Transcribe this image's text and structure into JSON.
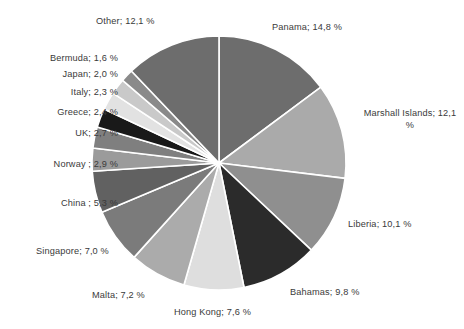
{
  "chart_data": {
    "type": "pie",
    "title": "",
    "subtitle": "",
    "xlabel": "",
    "ylabel": "",
    "legend_position": "none",
    "grid": false,
    "value_suffix": " %",
    "decimal_separator": ",",
    "label_separator": "; ",
    "start_angle_deg": 0,
    "direction": "clockwise",
    "categories": [
      "Panama",
      "Marshall Islands",
      "Liberia",
      "Bahamas",
      "Hong Kong",
      "Malta",
      "Singapore",
      "China ",
      "Norway ",
      "UK",
      "Greece",
      "Italy",
      "Japan",
      "Bermuda",
      "Other"
    ],
    "values": [
      14.8,
      12.1,
      10.1,
      9.8,
      7.6,
      7.2,
      7.0,
      5.3,
      2.9,
      2.7,
      2.4,
      2.3,
      2.0,
      1.6,
      12.1
    ],
    "total": 100.0,
    "slices": [
      {
        "name": "Panama",
        "value": 14.8,
        "label": "Panama; 14,8 %",
        "color": "#6d6d6d"
      },
      {
        "name": "Marshall Islands",
        "value": 12.1,
        "label": "Marshall Islands; 12,1\n%",
        "color": "#aaaaaa"
      },
      {
        "name": "Liberia",
        "value": 10.1,
        "label": "Liberia; 10,1 %",
        "color": "#8f8f8f"
      },
      {
        "name": "Bahamas",
        "value": 9.8,
        "label": "Bahamas; 9,8 %",
        "color": "#2b2b2b"
      },
      {
        "name": "Hong Kong",
        "value": 7.6,
        "label": "Hong Kong; 7,6 %",
        "color": "#dedede"
      },
      {
        "name": "Malta",
        "value": 7.2,
        "label": "Malta; 7,2 %",
        "color": "#ababab"
      },
      {
        "name": "Singapore",
        "value": 7.0,
        "label": "Singapore; 7,0 %",
        "color": "#7b7b7b"
      },
      {
        "name": "China ",
        "value": 5.3,
        "label": "China ; 5,3 %",
        "color": "#616161"
      },
      {
        "name": "Norway ",
        "value": 2.9,
        "label": "Norway ; 2,9 %",
        "color": "#9b9b9b"
      },
      {
        "name": "UK",
        "value": 2.7,
        "label": "UK; 2,7 %",
        "color": "#7f7f7f"
      },
      {
        "name": "Greece",
        "value": 2.4,
        "label": "Greece; 2,4 %",
        "color": "#191919"
      },
      {
        "name": "Italy",
        "value": 2.3,
        "label": "Italy; 2,3 %",
        "color": "#e2e2e2"
      },
      {
        "name": "Japan",
        "value": 2.0,
        "label": "Japan; 2,0 %",
        "color": "#c9c9c9"
      },
      {
        "name": "Bermuda",
        "value": 1.6,
        "label": "Bermuda; 1,6 %",
        "color": "#8a8a8a"
      },
      {
        "name": "Other",
        "value": 12.1,
        "label": "Other; 12,1 %",
        "color": "#6d6d6d"
      }
    ],
    "geometry": {
      "center_x": 219,
      "center_y": 163,
      "radius": 127,
      "slice_border_color": "#ffffff",
      "slice_border_width": 1.6,
      "background": "#ffffff"
    },
    "label_positions": [
      {
        "name": "Panama",
        "x": 272,
        "y": 22,
        "w": 120,
        "align": "left"
      },
      {
        "name": "Marshall Islands",
        "x": 358,
        "y": 108,
        "w": 104,
        "align": "center"
      },
      {
        "name": "Liberia",
        "x": 348,
        "y": 219,
        "w": 100,
        "align": "left"
      },
      {
        "name": "Bahamas",
        "x": 290,
        "y": 287,
        "w": 100,
        "align": "left"
      },
      {
        "name": "Hong Kong",
        "x": 174,
        "y": 307,
        "w": 110,
        "align": "left"
      },
      {
        "name": "Malta",
        "x": 92,
        "y": 290,
        "w": 82,
        "align": "left"
      },
      {
        "name": "Singapore",
        "x": 36,
        "y": 246,
        "w": 102,
        "align": "left"
      },
      {
        "name": "China ",
        "x": 20,
        "y": 198,
        "w": 98,
        "align": "right"
      },
      {
        "name": "Norway ",
        "x": 10,
        "y": 159,
        "w": 108,
        "align": "right"
      },
      {
        "name": "UK",
        "x": 28,
        "y": 128,
        "w": 90,
        "align": "right"
      },
      {
        "name": "Greece",
        "x": 10,
        "y": 107,
        "w": 108,
        "align": "right"
      },
      {
        "name": "Italy",
        "x": 22,
        "y": 87,
        "w": 96,
        "align": "right"
      },
      {
        "name": "Japan",
        "x": 22,
        "y": 69,
        "w": 96,
        "align": "right"
      },
      {
        "name": "Bermuda",
        "x": 10,
        "y": 53,
        "w": 108,
        "align": "right"
      },
      {
        "name": "Other",
        "x": 96,
        "y": 16,
        "w": 110,
        "align": "left"
      }
    ]
  }
}
